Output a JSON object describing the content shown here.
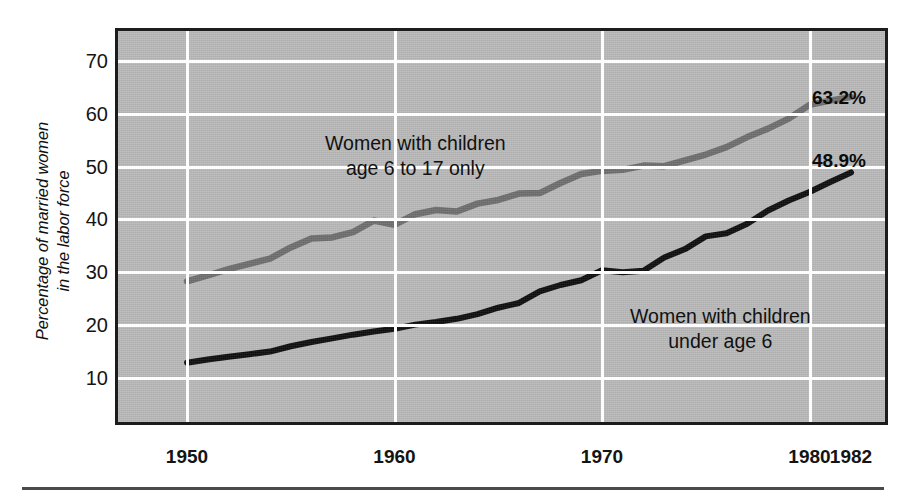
{
  "chart_data": {
    "type": "line",
    "title": "",
    "subtitle": "",
    "xlabel": "",
    "ylabel": "Percentage of married women in the labor force",
    "ylabel_line1": "Percentage of married women",
    "ylabel_line2": "in the labor force",
    "xlim": [
      1947,
      1984
    ],
    "ylim": [
      5,
      75
    ],
    "yticks": [
      70,
      60,
      50,
      40,
      30,
      20,
      10
    ],
    "xticks": [
      1950,
      1960,
      1970,
      1980,
      1982
    ],
    "xtick_labels": [
      "1950",
      "1960",
      "1970",
      "1980",
      "1982"
    ],
    "grid": true,
    "legend_position": "inline-annotations",
    "plot_background": "#b9b9b9",
    "gridline_color": "#ffffff",
    "series": [
      {
        "name": "Women with children age 6 to 17 only",
        "annotation_line1": "Women with children",
        "annotation_line2": "age 6 to 17 only",
        "color": "#6e6e6e",
        "end_label": "63.2%",
        "x": [
          1950,
          1951,
          1952,
          1953,
          1954,
          1955,
          1956,
          1957,
          1958,
          1959,
          1960,
          1961,
          1962,
          1963,
          1964,
          1965,
          1966,
          1967,
          1968,
          1969,
          1970,
          1971,
          1972,
          1973,
          1974,
          1975,
          1976,
          1977,
          1978,
          1979,
          1980,
          1981,
          1982
        ],
        "values": [
          28.3,
          29.4,
          30.6,
          31.6,
          32.6,
          34.7,
          36.4,
          36.6,
          37.6,
          39.8,
          39.0,
          41.0,
          41.8,
          41.5,
          43.0,
          43.7,
          44.9,
          45.0,
          46.9,
          48.6,
          49.2,
          49.4,
          50.2,
          50.1,
          51.2,
          52.3,
          53.7,
          55.6,
          57.2,
          59.1,
          61.7,
          62.5,
          63.2
        ]
      },
      {
        "name": "Women with children under age 6",
        "annotation_line1": "Women with children",
        "annotation_line2": "under age 6",
        "color": "#0d0d0d",
        "end_label": "48.9%",
        "x": [
          1950,
          1951,
          1952,
          1953,
          1954,
          1955,
          1956,
          1957,
          1958,
          1959,
          1960,
          1961,
          1962,
          1963,
          1964,
          1965,
          1966,
          1967,
          1968,
          1969,
          1970,
          1971,
          1972,
          1973,
          1974,
          1975,
          1976,
          1977,
          1978,
          1979,
          1980,
          1981,
          1982
        ],
        "values": [
          12.9,
          13.5,
          14.0,
          14.5,
          15.0,
          16.0,
          16.8,
          17.5,
          18.2,
          18.8,
          19.3,
          20.1,
          20.6,
          21.2,
          22.1,
          23.3,
          24.2,
          26.4,
          27.6,
          28.5,
          30.4,
          30.0,
          30.3,
          32.8,
          34.4,
          36.8,
          37.4,
          39.2,
          41.7,
          43.6,
          45.2,
          47.1,
          48.9
        ]
      }
    ]
  }
}
